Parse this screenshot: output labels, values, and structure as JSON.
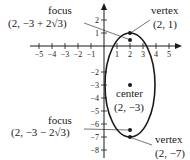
{
  "figure": {
    "type": "ellipse-graph",
    "equation_features": {
      "center": [
        2,
        -3
      ],
      "vertices": [
        [
          2,
          1
        ],
        [
          2,
          -7
        ]
      ],
      "foci": [
        "(2, -3 + 2√3)",
        "(2, -3 - 2√3)"
      ],
      "major_axis": "vertical",
      "semi_major": 4,
      "semi_minor": 2
    },
    "axes": {
      "x_ticks": [
        "−5",
        "−4",
        "−3",
        "−2",
        "−1",
        "1",
        "2",
        "3",
        "4",
        "5"
      ],
      "x_tick_values": [
        -5,
        -4,
        -3,
        -2,
        -1,
        1,
        2,
        3,
        4,
        5
      ],
      "y_ticks": [
        "2",
        "1",
        "−2",
        "−3",
        "−4",
        "−5",
        "−6",
        "−7",
        "−8"
      ],
      "y_tick_values": [
        2,
        1,
        -2,
        -3,
        -4,
        -5,
        -6,
        -7,
        -8
      ]
    },
    "annotations": {
      "focus_top": {
        "label": "focus",
        "coords": "(2, −3 + 2√3)"
      },
      "vertex_top": {
        "label": "vertex",
        "coords": "(2, 1)"
      },
      "center": {
        "label": "center",
        "coords": "(2, −3)"
      },
      "focus_bottom": {
        "label": "focus",
        "coords": "(2, −3 − 2√3)"
      },
      "vertex_bottom": {
        "label": "vertex",
        "coords": "(2, −7)"
      }
    },
    "colors": {
      "ink": "#1a1a1a",
      "background": "#ffffff"
    }
  }
}
